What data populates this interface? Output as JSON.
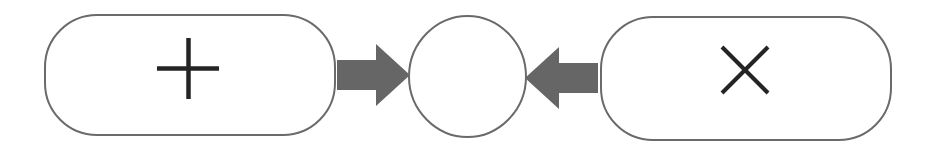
{
  "diagram": {
    "title": "Plus and Cross nodes converging on empty node",
    "background_color": "#ffffff",
    "width": 926,
    "height": 149,
    "stroke_color": "#6a6a6a",
    "glyph_color": "#242424",
    "arrow_color": "#666666",
    "nodes": [
      {
        "id": "left-node",
        "name": "plus-node",
        "shape": "rounded-rectangle",
        "label": "+",
        "glyph": "plus-icon",
        "x": 44,
        "y": 14,
        "width": 292,
        "height": 122,
        "corner_radius": 52,
        "fill": "#ffffff",
        "stroke": "#6a6a6a",
        "stroke_width": 2
      },
      {
        "id": "center-node",
        "name": "empty-node",
        "shape": "ellipse",
        "label": "",
        "glyph": "",
        "x": 408,
        "y": 15,
        "width": 119,
        "height": 123,
        "corner_radius": 59,
        "fill": "#ffffff",
        "stroke": "#6a6a6a",
        "stroke_width": 2
      },
      {
        "id": "right-node",
        "name": "cross-node",
        "shape": "rounded-rectangle",
        "label": "×",
        "glyph": "cross-icon",
        "x": 600,
        "y": 16,
        "width": 292,
        "height": 125,
        "corner_radius": 52,
        "fill": "#ffffff",
        "stroke": "#6a6a6a",
        "stroke_width": 2
      }
    ],
    "edges": [
      {
        "id": "edge-left-to-center",
        "name": "arrow-plus-to-empty",
        "from": "left-node",
        "to": "center-node",
        "direction": "right",
        "label": "",
        "color": "#666666",
        "x_start": 337,
        "x_end": 410,
        "y_center": 75,
        "shaft_height": 30,
        "head_height": 62,
        "head_length": 34
      },
      {
        "id": "edge-right-to-center",
        "name": "arrow-cross-to-empty",
        "from": "right-node",
        "to": "center-node",
        "direction": "left",
        "label": "",
        "color": "#666666",
        "x_start": 598,
        "x_end": 525,
        "y_center": 78,
        "shaft_height": 30,
        "head_height": 62,
        "head_length": 34
      }
    ]
  }
}
